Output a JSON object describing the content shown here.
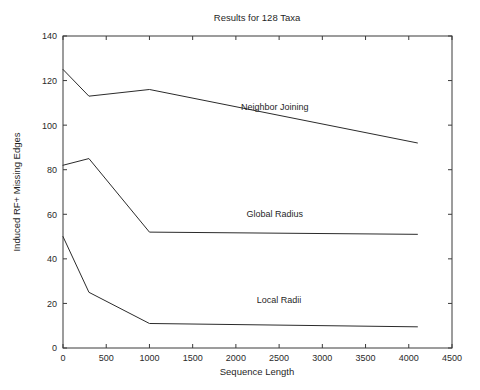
{
  "figure": {
    "width": 480,
    "height": 390,
    "background": "#ffffff",
    "line_color": "#2b2b2b",
    "axis_color": "#3a3a3a",
    "text_color": "#1f1f1f"
  },
  "chart_data": {
    "type": "line",
    "title": "Results for 128 Taxa",
    "xlabel": "Sequence Length",
    "ylabel": "Induced RF+ Missing Edges",
    "xlim": [
      0,
      4500
    ],
    "ylim": [
      0,
      140
    ],
    "xticks": [
      0,
      500,
      1000,
      1500,
      2000,
      2500,
      3000,
      3500,
      4000,
      4500
    ],
    "yticks": [
      0,
      20,
      40,
      60,
      80,
      100,
      120,
      140
    ],
    "xticklabels": [
      "0",
      "500",
      "1000",
      "1500",
      "2000",
      "2500",
      "3000",
      "3500",
      "4000",
      "4500"
    ],
    "yticklabels": [
      "0",
      "20",
      "40",
      "60",
      "80",
      "100",
      "120",
      "140"
    ],
    "grid": false,
    "legend_position": "inline-annotations",
    "x": [
      0,
      300,
      1000,
      4100
    ],
    "series": [
      {
        "name": "Neighbor Joining",
        "values": [
          125,
          113,
          116,
          92
        ],
        "label_x": 2450,
        "label_y": 107
      },
      {
        "name": "Global Radius",
        "values": [
          82,
          85,
          52,
          51
        ],
        "label_x": 2450,
        "label_y": 59
      },
      {
        "name": "Local Radii",
        "values": [
          50,
          25,
          11,
          9.5
        ],
        "label_x": 2500,
        "label_y": 20
      }
    ]
  }
}
